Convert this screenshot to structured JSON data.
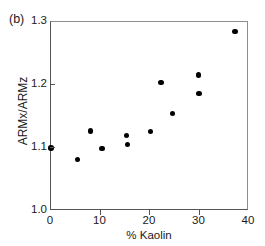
{
  "panel": {
    "label": "(b)"
  },
  "chart_data": {
    "type": "scatter",
    "title": "",
    "subtitle": "",
    "xlabel": "% Kaolin",
    "ylabel": "ARMx/ARMz",
    "xlim": [
      0,
      40
    ],
    "ylim": [
      1.0,
      1.3
    ],
    "xticks": [
      0,
      10,
      20,
      30,
      40
    ],
    "xticklabels": [
      "0",
      "10",
      "20",
      "30",
      "40"
    ],
    "yticks": [
      1.0,
      1.1,
      1.2,
      1.3
    ],
    "yticklabels": [
      "1.0",
      "1.1",
      "1.2",
      "1.3"
    ],
    "grid": false,
    "legend": null,
    "marker": "filled-circle",
    "marker_color": "#000000",
    "annotations": [
      "(b)"
    ],
    "points": [
      {
        "x": 0.0,
        "y": 1.1
      },
      {
        "x": 5.4,
        "y": 1.082
      },
      {
        "x": 8.0,
        "y": 1.127
      },
      {
        "x": 10.3,
        "y": 1.099
      },
      {
        "x": 15.3,
        "y": 1.12
      },
      {
        "x": 15.4,
        "y": 1.106
      },
      {
        "x": 20.1,
        "y": 1.126
      },
      {
        "x": 22.2,
        "y": 1.204
      },
      {
        "x": 24.6,
        "y": 1.155
      },
      {
        "x": 29.8,
        "y": 1.216
      },
      {
        "x": 29.9,
        "y": 1.187
      },
      {
        "x": 37.2,
        "y": 1.285
      }
    ]
  }
}
